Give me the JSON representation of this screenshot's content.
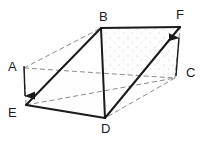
{
  "figure": {
    "kind": "geometry-diagram",
    "shape": "triangular-prism",
    "background_color": "#ffffff",
    "stroke_color": "#1a1a1a",
    "hidden_stroke_color": "#8c8c8c",
    "shaded_face_color": "#fbfbfb",
    "stipple_color": "#c8b8b8",
    "labels": [
      {
        "id": "A",
        "text": "A",
        "x": 8,
        "y": 60
      },
      {
        "id": "B",
        "text": "B",
        "x": 99,
        "y": 10
      },
      {
        "id": "C",
        "text": "C",
        "x": 186,
        "y": 66
      },
      {
        "id": "D",
        "text": "D",
        "x": 101,
        "y": 122
      },
      {
        "id": "E",
        "text": "E",
        "x": 8,
        "y": 106
      },
      {
        "id": "F",
        "text": "F",
        "x": 176,
        "y": 8
      }
    ],
    "vertices": {
      "B": {
        "x": 101,
        "y": 28
      },
      "F": {
        "x": 180,
        "y": 27
      },
      "E": {
        "x": 26,
        "y": 105
      },
      "D": {
        "x": 105,
        "y": 118
      },
      "A_corner": {
        "x": 24,
        "y": 68
      },
      "C_corner": {
        "x": 175,
        "y": 78
      }
    },
    "solid_edges": [
      {
        "name": "B-F",
        "from": "B",
        "to": "F"
      },
      {
        "name": "B-E",
        "from": "B",
        "to": "E"
      },
      {
        "name": "B-D",
        "from": "B",
        "to": "D"
      },
      {
        "name": "F-D",
        "from": "F",
        "to": "D"
      },
      {
        "name": "E-D",
        "from": "E",
        "to": "D"
      }
    ],
    "hidden_edges": [
      {
        "name": "A_corner-B",
        "from": "A_corner",
        "to": "B"
      },
      {
        "name": "A_corner-E",
        "from": "A_corner",
        "to": "E"
      },
      {
        "name": "A_corner-C_corner",
        "from": "A_corner",
        "to": "C_corner"
      },
      {
        "name": "C_corner-F",
        "from": "C_corner",
        "to": "F"
      },
      {
        "name": "C_corner-D",
        "from": "C_corner",
        "to": "D"
      },
      {
        "name": "E-C_corner",
        "from": "E",
        "to": "C_corner"
      }
    ],
    "arrows": [
      {
        "name": "arrow-A-down",
        "direction": "down",
        "x1": 24,
        "y1": 66,
        "x2": 25,
        "y2": 103
      },
      {
        "name": "arrow-C-up",
        "direction": "up",
        "x1": 176,
        "y1": 76,
        "x2": 179,
        "y2": 31
      }
    ]
  }
}
